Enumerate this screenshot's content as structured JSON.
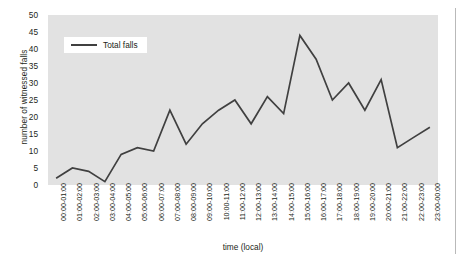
{
  "chart_data": {
    "type": "line",
    "title": "",
    "xlabel": "time (local)",
    "ylabel": "number of witnessed falls",
    "ylim": [
      0,
      50
    ],
    "ytick_step": 5,
    "grid": false,
    "legend_position": "top-left",
    "line_color": "#404040",
    "plot_background": "#e2e2e2",
    "categories": [
      "00:00-01:00",
      "01:00-02:00",
      "02:00-03:00",
      "03:00-04:00",
      "04:00-05:00",
      "05:00-06:00",
      "06:00-07:00",
      "07:00-08:00",
      "08:00-09:00",
      "09:00-10:00",
      "10:00-11:00",
      "11:00-12:00",
      "12:00-13:00",
      "13:00-14:00",
      "14:00-15:00",
      "15:00-16:00",
      "16:00-17:00",
      "17:00-18:00",
      "18:00-19:00",
      "19:00-20:00",
      "20:00-21:00",
      "21:00-22:00",
      "22:00-23:00",
      "23:00-00:00"
    ],
    "yticks": [
      0,
      5,
      10,
      15,
      20,
      25,
      30,
      35,
      40,
      45,
      50
    ],
    "series": [
      {
        "name": "Total falls",
        "values": [
          2,
          5,
          4,
          1,
          9,
          11,
          10,
          22,
          12,
          18,
          22,
          25,
          18,
          26,
          21,
          44,
          37,
          25,
          30,
          22,
          31,
          11,
          14,
          17
        ]
      }
    ]
  }
}
